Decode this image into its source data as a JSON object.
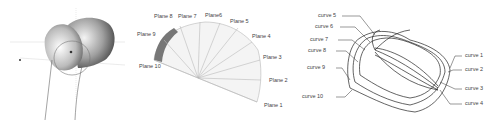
{
  "panels": [
    {
      "id": "bone-3d-model",
      "description": "3D shaded bone head with planes"
    },
    {
      "id": "radial-planes",
      "labels": [
        "Plane 1",
        "Plane 2",
        "Plane 3",
        "Plane 4",
        "Plane 5",
        "Plane6",
        "Plane 7",
        "Plane 8",
        "Plane 9",
        "Plane 10"
      ]
    },
    {
      "id": "cross-section-curves",
      "labels": [
        "curve 1",
        "curve 2",
        "curve 3",
        "curve 4",
        "curve 5",
        "curve 6",
        "curve 7",
        "curve 8",
        "curve 9",
        "curve 10"
      ]
    }
  ]
}
